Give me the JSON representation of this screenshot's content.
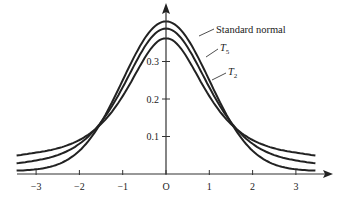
{
  "chart_data": {
    "type": "line",
    "title": "",
    "xlabel": "",
    "ylabel": "",
    "xlim": [
      -3.5,
      3.5
    ],
    "ylim": [
      0,
      0.4
    ],
    "grid": false,
    "x_ticks": [
      -3,
      -2,
      -1,
      0,
      1,
      2,
      3
    ],
    "x_tick_labels": [
      "−3",
      "−2",
      "−1",
      "O",
      "1",
      "2",
      "3"
    ],
    "y_ticks": [
      0.1,
      0.2,
      0.3
    ],
    "y_tick_labels": [
      "0.1",
      "0.2",
      "0.3"
    ],
    "series": [
      {
        "name": "Standard normal",
        "dist": "normal",
        "df": null,
        "peak": 0.399
      },
      {
        "name": "T5",
        "label_main": "T",
        "label_sub": "5",
        "dist": "t",
        "df": 5,
        "peak": 0.38
      },
      {
        "name": "T2",
        "label_main": "T",
        "label_sub": "2",
        "dist": "t",
        "df": 2,
        "peak": 0.354
      }
    ],
    "annotations": [
      {
        "text": "Standard normal",
        "target_series": "Standard normal"
      },
      {
        "text": "T5",
        "target_series": "T5"
      },
      {
        "text": "T2",
        "target_series": "T2"
      }
    ],
    "line_color": "#222222"
  }
}
